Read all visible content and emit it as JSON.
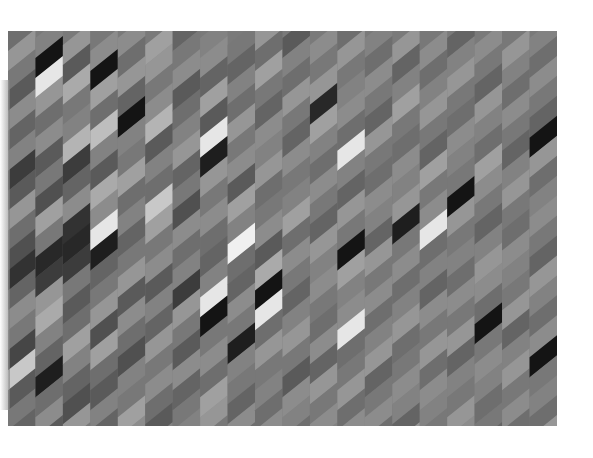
{
  "artwork": {
    "title": "Abstract grayscale parallelogram pattern",
    "background": "#ffffff",
    "columns": 20,
    "rows": 22,
    "shades": [
      [
        110,
        150,
        120,
        90,
        140,
        100,
        130,
        60,
        90,
        150,
        110,
        80,
        50,
        100,
        140,
        120,
        70,
        200,
        90,
        120,
        100,
        130
      ],
      [
        130,
        20,
        230,
        150,
        110,
        140,
        90,
        120,
        80,
        160,
        120,
        40,
        60,
        150,
        170,
        130,
        100,
        30,
        110,
        140,
        90,
        120
      ],
      [
        150,
        90,
        170,
        120,
        130,
        180,
        60,
        100,
        140,
        50,
        40,
        60,
        120,
        90,
        110,
        160,
        130,
        100,
        80,
        150,
        120,
        140
      ],
      [
        120,
        140,
        20,
        160,
        110,
        190,
        130,
        90,
        170,
        140,
        230,
        30,
        100,
        120,
        150,
        80,
        160,
        110,
        90,
        130,
        100,
        120
      ],
      [
        140,
        110,
        150,
        100,
        20,
        130,
        120,
        160,
        110,
        130,
        100,
        120,
        150,
        90,
        140,
        110,
        80,
        130,
        120,
        160,
        140,
        130
      ],
      [
        160,
        150,
        120,
        140,
        180,
        90,
        130,
        110,
        200,
        160,
        120,
        140,
        90,
        130,
        100,
        150,
        120,
        140,
        110,
        90,
        130,
        150
      ],
      [
        100,
        120,
        140,
        90,
        110,
        130,
        150,
        100,
        120,
        80,
        140,
        110,
        130,
        60,
        150,
        120,
        90,
        140,
        100,
        120,
        130,
        110
      ],
      [
        130,
        140,
        100,
        160,
        90,
        230,
        30,
        150,
        120,
        140,
        110,
        100,
        130,
        230,
        20,
        120,
        140,
        110,
        160,
        150,
        120,
        140
      ],
      [
        120,
        100,
        130,
        110,
        150,
        120,
        140,
        90,
        160,
        130,
        240,
        110,
        100,
        140,
        120,
        30,
        130,
        120,
        100,
        140,
        110,
        130
      ],
      [
        150,
        110,
        160,
        120,
        100,
        140,
        130,
        150,
        110,
        120,
        140,
        90,
        170,
        20,
        230,
        110,
        150,
        120,
        130,
        110,
        140,
        120
      ],
      [
        90,
        130,
        110,
        150,
        120,
        100,
        140,
        120,
        130,
        160,
        110,
        140,
        120,
        100,
        130,
        150,
        120,
        90,
        140,
        130,
        110,
        150
      ],
      [
        140,
        120,
        150,
        40,
        160,
        130,
        110,
        140,
        120,
        100,
        150,
        130,
        140,
        120,
        110,
        140,
        100,
        150,
        120,
        140,
        130,
        110
      ],
      [
        110,
        150,
        120,
        130,
        140,
        110,
        230,
        130,
        100,
        150,
        120,
        20,
        160,
        130,
        140,
        230,
        110,
        120,
        150,
        110,
        140,
        120
      ],
      [
        130,
        110,
        140,
        120,
        100,
        150,
        120,
        110,
        140,
        130,
        100,
        150,
        120,
        140,
        110,
        130,
        150,
        100,
        120,
        140,
        110,
        130
      ],
      [
        150,
        100,
        130,
        160,
        120,
        110,
        140,
        130,
        150,
        30,
        120,
        140,
        110,
        130,
        150,
        110,
        120,
        140,
        130,
        100,
        150,
        120
      ],
      [
        120,
        140,
        110,
        130,
        150,
        120,
        100,
        160,
        120,
        140,
        230,
        110,
        130,
        100,
        140,
        120,
        150,
        110,
        140,
        130,
        120,
        140
      ],
      [
        100,
        130,
        150,
        120,
        110,
        140,
        130,
        120,
        20,
        150,
        120,
        130,
        110,
        140,
        120,
        150,
        100,
        130,
        120,
        150,
        140,
        110
      ],
      [
        140,
        120,
        100,
        150,
        130,
        110,
        160,
        140,
        120,
        100,
        130,
        150,
        140,
        110,
        20,
        120,
        140,
        130,
        110,
        120,
        100,
        150
      ],
      [
        120,
        150,
        130,
        110,
        140,
        120,
        100,
        130,
        150,
        120,
        110,
        140,
        130,
        120,
        150,
        100,
        130,
        150,
        120,
        140,
        110,
        130
      ],
      [
        130,
        110,
        140,
        120,
        100,
        20,
        150,
        110,
        130,
        140,
        120,
        100,
        150,
        130,
        110,
        140,
        20,
        120,
        130,
        110,
        150,
        120
      ]
    ]
  }
}
